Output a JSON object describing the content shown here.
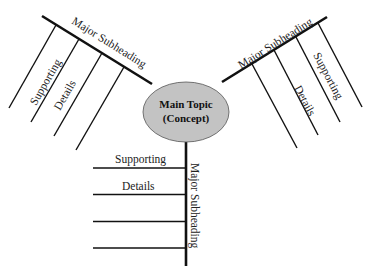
{
  "diagram": {
    "type": "spider-map",
    "center": {
      "line1": "Main Topic",
      "line2": "(Concept)",
      "fill": "#c3c3c3"
    },
    "branches": [
      {
        "position": "upper-left",
        "heading": "Major Subheading",
        "details": [
          "Supporting",
          "Details",
          "",
          ""
        ]
      },
      {
        "position": "upper-right",
        "heading": "Major Subheading",
        "details": [
          "Supporting",
          "Details",
          "",
          ""
        ]
      },
      {
        "position": "bottom",
        "heading": "Major Subheading",
        "details": [
          "Supporting",
          "Details",
          "",
          ""
        ]
      }
    ]
  }
}
